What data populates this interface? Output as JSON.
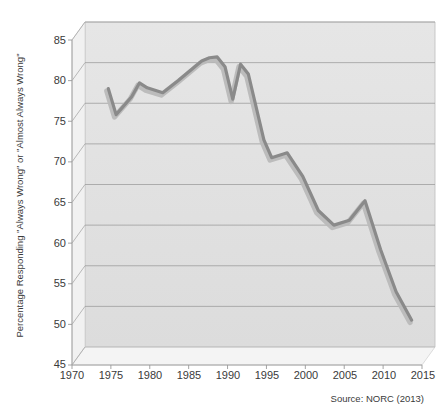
{
  "chart_data": {
    "type": "line",
    "title": "",
    "xlabel": "",
    "ylabel": "Percentage Responding \"Always Wrong\" or \"Almost Always Wrong\"",
    "xlim": [
      1970,
      2015
    ],
    "ylim": [
      45,
      85
    ],
    "xticks": [
      1970,
      1975,
      1980,
      1985,
      1990,
      1995,
      2000,
      2005,
      2010,
      2015
    ],
    "yticks": [
      45,
      50,
      55,
      60,
      65,
      70,
      75,
      80,
      85
    ],
    "grid": "horizontal",
    "legend": "none",
    "style": "3d-perspective-area-floor",
    "series": [
      {
        "name": "Percentage Responding \"Always Wrong\" or \"Almost Always Wrong\"",
        "color": "#8a8a8a",
        "x": [
          1973,
          1974,
          1976,
          1977,
          1978,
          1980,
          1982,
          1983,
          1984,
          1985,
          1986,
          1987,
          1988,
          1989,
          1990,
          1991,
          1993,
          1994,
          1996,
          1998,
          2000,
          2002,
          2004,
          2006,
          2008,
          2010,
          2012
        ],
        "y": [
          76.8,
          73.6,
          75.8,
          77.5,
          76.9,
          76.3,
          77.8,
          78.6,
          79.4,
          80.2,
          80.6,
          80.7,
          79.5,
          75.5,
          79.8,
          78.6,
          70.5,
          68.3,
          68.9,
          66.0,
          61.8,
          60.0,
          60.6,
          63.0,
          57.0,
          51.8,
          48.3
        ]
      }
    ],
    "source_note": "Source: NORC (2013)"
  },
  "axes": {
    "y_title": "Percentage Responding \"Always Wrong\" or \"Almost Always Wrong\"",
    "y_tick_labels": [
      "85",
      "80",
      "75",
      "70",
      "65",
      "60",
      "55",
      "50",
      "45"
    ],
    "x_tick_labels": [
      "1970",
      "1975",
      "1980",
      "1985",
      "1990",
      "1995",
      "2000",
      "2005",
      "2010",
      "2015"
    ]
  },
  "footer": {
    "source": "Source: NORC (2013)"
  },
  "colors": {
    "line": "#8a8a8a",
    "line_shadow": "#b9b9b9",
    "floor": "#e2e2e2",
    "wall": "#ececec",
    "grid": "#9a9a9a",
    "text": "#3a3a3a"
  }
}
